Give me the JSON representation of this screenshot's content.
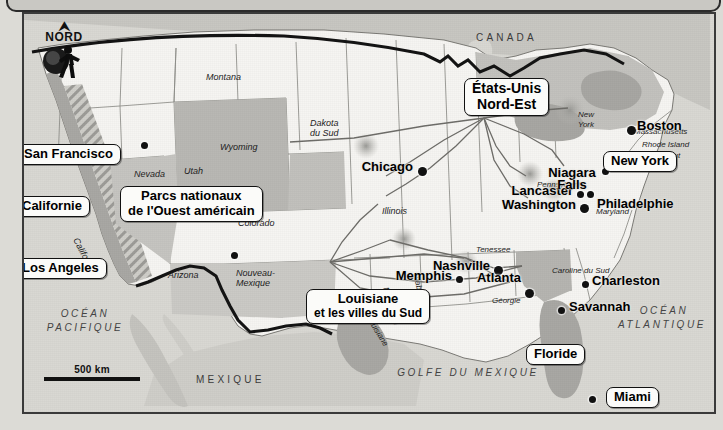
{
  "map": {
    "title_visible": false,
    "compass": {
      "arrow": "north-arrow",
      "label": "NORD"
    },
    "scale": {
      "label": "500 km"
    },
    "countries": [
      {
        "name": "CANADA"
      },
      {
        "name": "MEXIQUE"
      }
    ],
    "oceans": [
      {
        "name": "OCÉAN\nPACIFIQUE",
        "line1": "OCÉAN",
        "line2": "PACIFIQUE"
      },
      {
        "name": "OCÉAN\nATLANTIQUE",
        "line1": "OCÉAN",
        "line2": "ATLANTIQUE"
      },
      {
        "name": "GOLFE DU MEXIQUE"
      }
    ],
    "states": [
      "Montana",
      "Dakota du Sud",
      "Wyoming",
      "Nevada",
      "Utah",
      "Colorado",
      "Californie",
      "Arizona",
      "Nouveau-Mexique",
      "Illinois",
      "New York",
      "Massachusetts",
      "Rhode Island",
      "Connecticut",
      "Pennsylvanie",
      "Maryland",
      "Tenessee",
      "Caroline du Sud",
      "Alabama",
      "Géorgie",
      "Mississippi",
      "Louisiane"
    ],
    "cities": [
      {
        "name": "San Francisco"
      },
      {
        "name": "Los Angeles"
      },
      {
        "name": "Chicago"
      },
      {
        "name": "Boston"
      },
      {
        "name": "Lancaster"
      },
      {
        "name": "Philadelphie"
      },
      {
        "name": "Washington"
      },
      {
        "name": "Nashville"
      },
      {
        "name": "Memphis"
      },
      {
        "name": "Atlanta"
      },
      {
        "name": "Charleston"
      },
      {
        "name": "Savannah"
      },
      {
        "name": "Miami"
      }
    ],
    "callouts": [
      {
        "name": "San Francisco",
        "line2": ""
      },
      {
        "name": "Californie",
        "line2": ""
      },
      {
        "name": "Los Angeles",
        "line2": ""
      },
      {
        "name": "Parcs nationaux",
        "line2": "de l'Ouest américain"
      },
      {
        "name": "États-Unis",
        "line2": "Nord-Est"
      },
      {
        "name": "Niagara Falls",
        "line2": ""
      },
      {
        "name": "Boston",
        "line2": ""
      },
      {
        "name": "New York",
        "line2": ""
      },
      {
        "name": "Louisiane",
        "line2": "et les villes du Sud"
      },
      {
        "name": "Floride",
        "line2": ""
      },
      {
        "name": "Miami",
        "line2": ""
      }
    ],
    "labels": {
      "nord": "NORD",
      "scale_500km": "500 km",
      "canada": "CANADA",
      "mexique": "MEXIQUE",
      "ocean_pacifique_1": "OCÉAN",
      "ocean_pacifique_2": "PACIFIQUE",
      "ocean_atlantique_1": "OCÉAN",
      "ocean_atlantique_2": "ATLANTIQUE",
      "golfe": "GOLFE DU MEXIQUE",
      "montana": "Montana",
      "dakota_du_sud_1": "Dakota",
      "dakota_du_sud_2": "du Sud",
      "wyoming": "Wyoming",
      "nevada": "Nevada",
      "utah": "Utah",
      "colorado": "Colorado",
      "californie_state": "Californie",
      "arizona": "Arizona",
      "nouveau_mexique_1": "Nouveau-",
      "nouveau_mexique_2": "Mexique",
      "illinois": "Illinois",
      "new_york_state_1": "New",
      "new_york_state_2": "York",
      "massachusetts": "Massachusetts",
      "rhode_island": "Rhode Island",
      "connecticut": "Connecticut",
      "pennsylvanie": "Pennsylvanie",
      "maryland": "Maryland",
      "tenessee": "Tenessee",
      "caroline_du_sud": "Caroline du Sud",
      "alabama": "Alabama",
      "georgie": "Géorgie",
      "mississippi": "Mississippi",
      "louisiane_state": "Louisiane",
      "san_francisco": "San Francisco",
      "californie_box": "Californie",
      "los_angeles": "Los Angeles",
      "parcs_l1": "Parcs nationaux",
      "parcs_l2": "de l'Ouest américain",
      "etats_unis_l1": "États-Unis",
      "etats_unis_l2": "Nord-Est",
      "niagara_l1": "Niagara",
      "niagara_l2": "Falls",
      "boston": "Boston",
      "new_york_box": "New York",
      "lancaster": "Lancaster",
      "philadelphie": "Philadelphie",
      "washington": "Washington",
      "chicago": "Chicago",
      "nashville": "Nashville",
      "memphis": "Memphis",
      "atlanta": "Atlanta",
      "charleston": "Charleston",
      "savannah": "Savannah",
      "louisiane_box_l1": "Louisiane",
      "louisiane_box_l2": "et les villes du Sud",
      "floride": "Floride",
      "miami": "Miami"
    },
    "colors": {
      "sea": "#d9d8d3",
      "land_light": "#f6f5f2",
      "land_highlight": "#b9b8b4",
      "land_neighbor": "#c8c7c2",
      "border": "#3a3a3a",
      "route": "#6a6a6a",
      "ink": "#111111",
      "box_fill": "#fbfbf9"
    }
  }
}
